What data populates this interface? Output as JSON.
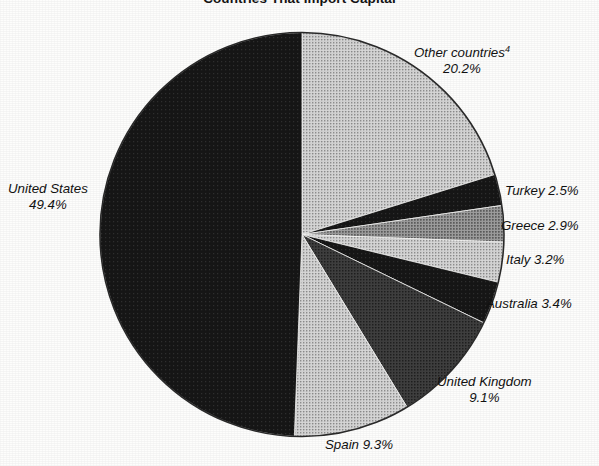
{
  "chart_data": {
    "type": "pie",
    "title": "Countries That Import Capital",
    "xlabel": "",
    "ylabel": "",
    "legend_position": "callout-labels",
    "grid": false,
    "start_angle_deg": 0,
    "direction": "clockwise",
    "units": "percent",
    "categories": [
      "Other countries",
      "Turkey",
      "Greece",
      "Italy",
      "Australia",
      "United Kingdom",
      "Spain",
      "United States"
    ],
    "values": [
      20.2,
      2.5,
      2.9,
      3.2,
      3.4,
      9.1,
      9.3,
      49.4
    ],
    "slices": [
      {
        "name": "Other countries",
        "label_line1": "Other countries",
        "label_line2": "20.2%",
        "footnote_marker": "4",
        "value": 20.2,
        "value_text": "20.2%",
        "color": "#b9b9b9",
        "two_line": true
      },
      {
        "name": "Turkey",
        "label_line1": "Turkey 2.5%",
        "label_line2": "",
        "footnote_marker": "",
        "value": 2.5,
        "value_text": "2.5%",
        "color": "#1d1d1d",
        "two_line": false
      },
      {
        "name": "Greece",
        "label_line1": "Greece 2.9%",
        "label_line2": "",
        "footnote_marker": "",
        "value": 2.9,
        "value_text": "2.9%",
        "color": "#9c9c9c",
        "two_line": false
      },
      {
        "name": "Italy",
        "label_line1": "Italy 3.2%",
        "label_line2": "",
        "footnote_marker": "",
        "value": 3.2,
        "value_text": "3.2%",
        "color": "#c2c2c2",
        "two_line": false
      },
      {
        "name": "Australia",
        "label_line1": "Australia 3.4%",
        "label_line2": "",
        "footnote_marker": "",
        "value": 3.4,
        "value_text": "3.4%",
        "color": "#232323",
        "two_line": false
      },
      {
        "name": "United Kingdom",
        "label_line1": "United Kingdom",
        "label_line2": "9.1%",
        "footnote_marker": "",
        "value": 9.1,
        "value_text": "9.1%",
        "color": "#3d3d3d",
        "two_line": true
      },
      {
        "name": "Spain",
        "label_line1": "Spain 9.3%",
        "label_line2": "",
        "footnote_marker": "",
        "value": 9.3,
        "value_text": "9.3%",
        "color": "#cfcfcf",
        "two_line": false
      },
      {
        "name": "United States",
        "label_line1": "United States",
        "label_line2": "49.4%",
        "footnote_marker": "",
        "value": 49.4,
        "value_text": "49.4%",
        "color": "#121212",
        "two_line": true
      }
    ]
  },
  "colors": {
    "background": "#fdfdfc",
    "text": "#111111",
    "outline": "#2a2a2a"
  }
}
